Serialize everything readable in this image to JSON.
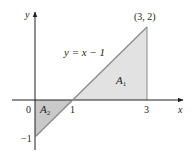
{
  "diagram": {
    "type": "area-between-curve-and-axis",
    "curve_label": "y = x − 1",
    "point_label": "(3, 2)",
    "axis_labels": {
      "x": "x",
      "y": "y"
    },
    "tick_labels": {
      "origin": "0",
      "one": "1",
      "three": "3",
      "neg_one": "−1"
    },
    "regions": [
      {
        "name": "A",
        "sub": "1",
        "description": "triangle above x-axis between x=1 and x=3",
        "fill": "#e2e2e2"
      },
      {
        "name": "A",
        "sub": "2",
        "description": "triangle below x-axis between x=0 and x=1",
        "fill": "#c9c9c9"
      }
    ],
    "colors": {
      "line": "#8a8a8a",
      "axis": "#231f20",
      "text": "#231f20"
    }
  }
}
